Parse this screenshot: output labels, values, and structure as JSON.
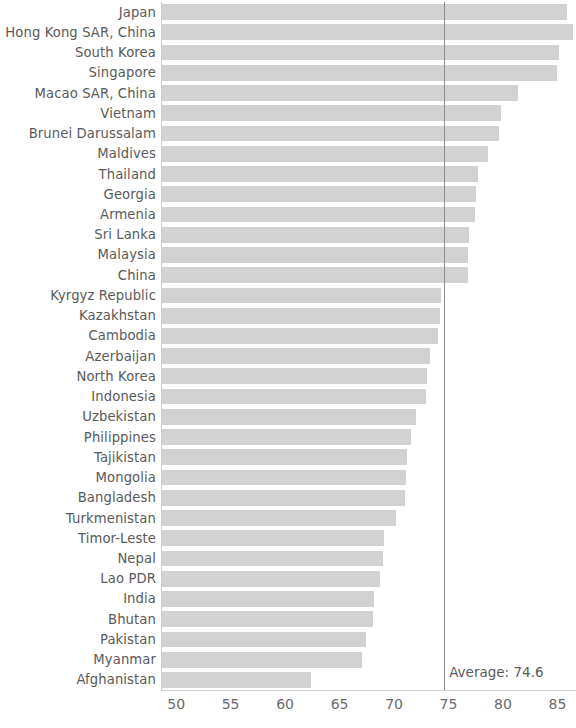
{
  "chart_data": {
    "type": "bar",
    "orientation": "horizontal",
    "title": "",
    "subtitle": "",
    "xlabel": "",
    "ylabel": "",
    "xlim": [
      48.7,
      86.7
    ],
    "ylim": [
      0,
      37
    ],
    "grid": false,
    "legend": null,
    "bar_color": "#d2d2d2",
    "xticks": [
      50,
      55,
      60,
      65,
      70,
      75,
      80,
      85
    ],
    "xtick_labels": [
      "50",
      "55",
      "60",
      "65",
      "70",
      "75",
      "80",
      "85"
    ],
    "annotations": [
      {
        "name": "average-line",
        "label": "Average: 74.6",
        "value": 74.6,
        "color": "#8d8d8d"
      }
    ],
    "categories": [
      "Japan",
      "Hong Kong SAR, China",
      "South Korea",
      "Singapore",
      "Macao SAR, China",
      "Vietnam",
      "Brunei Darussalam",
      "Maldives",
      "Thailand",
      "Georgia",
      "Armenia",
      "Sri Lanka",
      "Malaysia",
      "China",
      "Kyrgyz Republic",
      "Kazakhstan",
      "Cambodia",
      "Azerbaijan",
      "North Korea",
      "Indonesia",
      "Uzbekistan",
      "Philippines",
      "Tajikistan",
      "Mongolia",
      "Bangladesh",
      "Turkmenistan",
      "Timor-Leste",
      "Nepal",
      "Lao PDR",
      "India",
      "Bhutan",
      "Pakistan",
      "Myanmar",
      "Afghanistan"
    ],
    "values": [
      85.9,
      86.4,
      85.1,
      85.0,
      81.4,
      79.8,
      79.6,
      78.6,
      77.7,
      77.5,
      77.4,
      76.9,
      76.8,
      76.8,
      74.3,
      74.2,
      74.0,
      73.3,
      73.0,
      72.9,
      72.0,
      71.6,
      71.2,
      71.1,
      71.0,
      70.2,
      69.1,
      69.0,
      68.7,
      68.2,
      68.1,
      67.4,
      67.1,
      62.4
    ]
  }
}
